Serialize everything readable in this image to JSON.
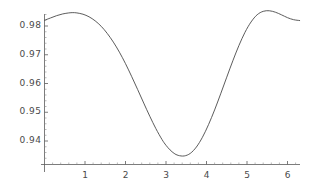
{
  "chart_data": {
    "type": "line",
    "title": "",
    "subtitle": "",
    "xlabel": "",
    "ylabel": "",
    "xlim": [
      0,
      6.3
    ],
    "ylim": [
      0.9285,
      0.9855
    ],
    "grid": false,
    "legend": null,
    "axis_origin_y": 0.9318,
    "xticks": [
      1,
      2,
      3,
      4,
      5,
      6
    ],
    "xtick_labels": [
      "1",
      "2",
      "3",
      "4",
      "5",
      "6"
    ],
    "yticks": [
      0.94,
      0.95,
      0.96,
      0.97,
      0.98
    ],
    "ytick_labels": [
      "0.94",
      "0.95",
      "0.96",
      "0.97",
      "0.98"
    ],
    "series": [
      {
        "name": "curve",
        "color": "#4a4a4a",
        "x": [
          0.0,
          0.15,
          0.3,
          0.45,
          0.6,
          0.7,
          0.8,
          0.95,
          1.1,
          1.25,
          1.4,
          1.55,
          1.7,
          1.85,
          2.0,
          2.15,
          2.3,
          2.45,
          2.6,
          2.75,
          2.9,
          3.0,
          3.1,
          3.2,
          3.3,
          3.45,
          3.6,
          3.75,
          3.9,
          4.05,
          4.2,
          4.35,
          4.5,
          4.65,
          4.8,
          4.95,
          5.1,
          5.25,
          5.4,
          5.55,
          5.7,
          5.85,
          6.0,
          6.15,
          6.3
        ],
        "y": [
          0.982,
          0.9828,
          0.9836,
          0.9842,
          0.98455,
          0.98465,
          0.98455,
          0.9841,
          0.9832,
          0.9818,
          0.9799,
          0.9774,
          0.9744,
          0.9709,
          0.9669,
          0.9625,
          0.9579,
          0.9532,
          0.9486,
          0.9443,
          0.94055,
          0.9385,
          0.9369,
          0.9357,
          0.935,
          0.9348,
          0.9357,
          0.9379,
          0.9413,
          0.9457,
          0.9508,
          0.9564,
          0.9622,
          0.9679,
          0.9732,
          0.9778,
          0.9814,
          0.9839,
          0.9851,
          0.9853,
          0.9848,
          0.9839,
          0.9829,
          0.9822,
          0.9819
        ]
      }
    ]
  },
  "axes": {
    "x_axis_name": "x-axis-line",
    "y_axis_name": "y-axis-line"
  }
}
